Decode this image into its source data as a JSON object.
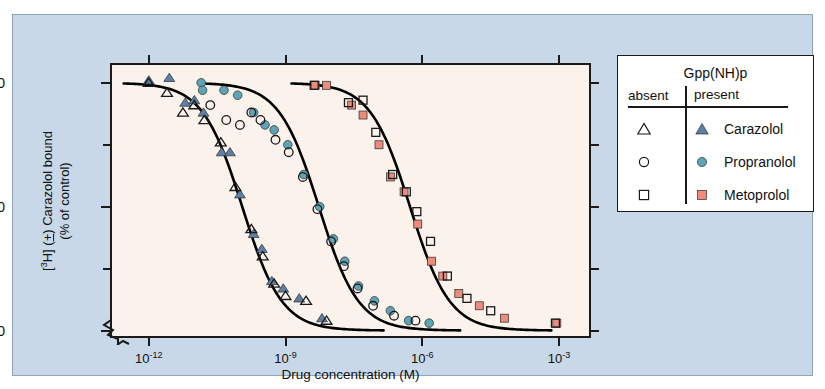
{
  "figure": {
    "panel_bg": "#c8d8e8",
    "plot_bg": "#fbf2ec"
  },
  "axes": {
    "x_title": "Drug concentration (M)",
    "y_title_line1": "[3H] (±) Carazolol bound",
    "y_title_line2": "(% of control)",
    "x_ticks": [
      {
        "label": "10",
        "exp": "-12",
        "value": -12
      },
      {
        "label": "10",
        "exp": "-9",
        "value": -9
      },
      {
        "label": "10",
        "exp": "-6",
        "value": -6
      },
      {
        "label": "10",
        "exp": "-3",
        "value": -3
      }
    ],
    "y_ticks_major": [
      "100",
      "50",
      "0"
    ],
    "y_ticks_minor": [
      "75",
      "25"
    ],
    "xlim": [
      -12.85,
      -2.3
    ],
    "ylim": [
      -3,
      108
    ],
    "axis_break": true
  },
  "legend": {
    "title": "Gpp(NH)p",
    "col_absent": "absent",
    "col_present": "present",
    "rows": [
      {
        "name": "Carazolol",
        "marker": "triangle",
        "color": "#5b7fa6"
      },
      {
        "name": "Propranolol",
        "marker": "circle",
        "color": "#5fa4b5"
      },
      {
        "name": "Metoprolol",
        "marker": "square",
        "color": "#ee8b7c"
      }
    ]
  },
  "chart_data": {
    "type": "scatter",
    "title": "",
    "xlabel": "Drug concentration (M)",
    "ylabel": "[3H] (±) Carazolol bound (% of control)",
    "xlabel_note": "x values are log10 of molar drug concentration",
    "xlim": [
      -12.85,
      -2.3
    ],
    "ylim": [
      -3,
      108
    ],
    "grid": false,
    "legend_position": "right-outside",
    "series": [
      {
        "name": "Carazolol",
        "condition": "Gpp(NH)p present",
        "marker": "triangle-filled",
        "color": "#5b7fa6",
        "points": [
          [
            -12.0,
            101
          ],
          [
            -11.55,
            102
          ],
          [
            -11.2,
            92
          ],
          [
            -11.0,
            93
          ],
          [
            -10.8,
            88
          ],
          [
            -10.4,
            72
          ],
          [
            -10.22,
            72
          ],
          [
            -10.0,
            55
          ],
          [
            -9.7,
            39
          ],
          [
            -9.52,
            33
          ],
          [
            -9.3,
            20
          ],
          [
            -9.05,
            17
          ],
          [
            -8.7,
            13
          ],
          [
            -8.2,
            5
          ]
        ]
      },
      {
        "name": "Carazolol",
        "condition": "Gpp(NH)p absent",
        "marker": "triangle-open",
        "color": "#ffffff",
        "points": [
          [
            -12.0,
            100
          ],
          [
            -11.6,
            96
          ],
          [
            -11.25,
            88
          ],
          [
            -11.0,
            91
          ],
          [
            -10.78,
            85
          ],
          [
            -10.42,
            76
          ],
          [
            -10.1,
            58
          ],
          [
            -9.75,
            41
          ],
          [
            -9.5,
            30
          ],
          [
            -9.25,
            19
          ],
          [
            -9.0,
            14
          ],
          [
            -8.55,
            12
          ],
          [
            -8.1,
            4
          ]
        ]
      },
      {
        "name": "Propranolol",
        "condition": "Gpp(NH)p present",
        "marker": "circle-filled",
        "color": "#5fa4b5",
        "points": [
          [
            -10.85,
            100
          ],
          [
            -10.82,
            97
          ],
          [
            -10.35,
            97
          ],
          [
            -10.05,
            95
          ],
          [
            -9.7,
            88
          ],
          [
            -9.45,
            83
          ],
          [
            -9.25,
            81
          ],
          [
            -8.95,
            75
          ],
          [
            -8.6,
            63
          ],
          [
            -8.25,
            50
          ],
          [
            -7.95,
            37
          ],
          [
            -7.7,
            28
          ],
          [
            -7.4,
            18
          ],
          [
            -7.05,
            12
          ],
          [
            -6.7,
            8
          ],
          [
            -6.3,
            4
          ],
          [
            -5.85,
            3
          ]
        ]
      },
      {
        "name": "Propranolol",
        "condition": "Gpp(NH)p absent",
        "marker": "circle-open",
        "color": "#ffffff",
        "points": [
          [
            -10.65,
            91
          ],
          [
            -10.3,
            85
          ],
          [
            -10.0,
            83
          ],
          [
            -9.75,
            88
          ],
          [
            -9.55,
            85
          ],
          [
            -9.22,
            77
          ],
          [
            -8.93,
            72
          ],
          [
            -8.62,
            62
          ],
          [
            -8.3,
            49
          ],
          [
            -8.0,
            36
          ],
          [
            -7.72,
            26
          ],
          [
            -7.42,
            17
          ],
          [
            -7.08,
            10
          ],
          [
            -6.62,
            6
          ],
          [
            -6.15,
            4
          ]
        ]
      },
      {
        "name": "Metoprolol",
        "condition": "Gpp(NH)p present",
        "marker": "square-filled",
        "color": "#ee8b7c",
        "points": [
          [
            -8.35,
            99
          ],
          [
            -8.1,
            99
          ],
          [
            -7.55,
            91
          ],
          [
            -7.3,
            87
          ],
          [
            -6.95,
            75
          ],
          [
            -6.7,
            62
          ],
          [
            -6.4,
            56
          ],
          [
            -6.1,
            43
          ],
          [
            -5.8,
            28
          ],
          [
            -5.55,
            22
          ],
          [
            -5.2,
            15
          ],
          [
            -4.75,
            10
          ],
          [
            -4.2,
            5
          ],
          [
            -3.05,
            3
          ]
        ]
      },
      {
        "name": "Metoprolol",
        "condition": "Gpp(NH)p absent",
        "marker": "square-open",
        "color": "#ffffff",
        "points": [
          [
            -8.37,
            99
          ],
          [
            -7.62,
            92
          ],
          [
            -7.3,
            93
          ],
          [
            -7.02,
            80
          ],
          [
            -6.65,
            63
          ],
          [
            -6.35,
            56
          ],
          [
            -6.12,
            48
          ],
          [
            -5.82,
            36
          ],
          [
            -5.45,
            22
          ],
          [
            -5.02,
            13
          ],
          [
            -4.5,
            8
          ],
          [
            -3.08,
            3
          ]
        ]
      }
    ],
    "fit_curves": [
      {
        "name": "Carazolol fit",
        "ic50_log": -9.95,
        "hill": 1.0
      },
      {
        "name": "Propranolol fit",
        "ic50_log": -8.27,
        "hill": 1.0
      },
      {
        "name": "Metoprolol fit",
        "ic50_log": -6.27,
        "hill": 1.0
      }
    ]
  }
}
